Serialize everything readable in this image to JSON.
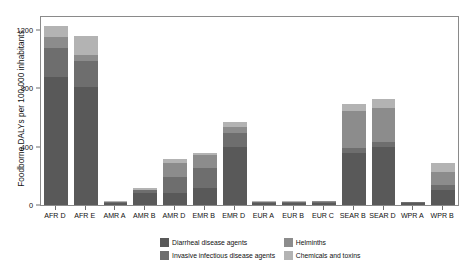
{
  "chart_data": {
    "type": "bar",
    "title": "",
    "subtitle": "",
    "xlabel": "",
    "ylabel": "Foodborne DALYs per 100,000 inhabitants",
    "ylim": [
      0,
      1290
    ],
    "yticks": [
      0,
      400,
      800,
      1200
    ],
    "ytick_labels": [
      "0",
      "400",
      "800",
      "1200"
    ],
    "grid": false,
    "stacked": true,
    "legend_position": "bottom",
    "categories": [
      "AFR D",
      "AFR E",
      "AMR A",
      "AMR B",
      "AMR D",
      "EMR B",
      "EMR D",
      "EUR A",
      "EUR B",
      "EUR C",
      "SEAR B",
      "SEAR D",
      "WPR A",
      "WPR B"
    ],
    "series": [
      {
        "name": "Diarrheal disease agents",
        "color": "#595959",
        "values": [
          880,
          810,
          14,
          80,
          80,
          120,
          400,
          13,
          16,
          17,
          355,
          395,
          13,
          100
        ]
      },
      {
        "name": "Invasive infectious disease agents",
        "color": "#6e6e6e",
        "values": [
          195,
          180,
          5,
          20,
          115,
          135,
          95,
          6,
          6,
          6,
          35,
          40,
          5,
          40
        ]
      },
      {
        "name": "Helminths",
        "color": "#8c8c8c",
        "values": [
          80,
          40,
          2,
          5,
          95,
          85,
          40,
          2,
          2,
          2,
          255,
          230,
          2,
          90
        ]
      },
      {
        "name": "Chemicals and toxins",
        "color": "#b3b3b3",
        "values": [
          75,
          130,
          4,
          10,
          25,
          20,
          35,
          4,
          5,
          5,
          45,
          60,
          4,
          60
        ]
      }
    ],
    "totals": [
      1230,
      1160,
      25,
      115,
      315,
      360,
      570,
      25,
      29,
      30,
      690,
      725,
      24,
      290
    ],
    "legend_entries": [
      "Diarrheal disease agents",
      "Invasive infectious disease agents",
      "Helminths",
      "Chemicals and toxins"
    ]
  },
  "colors": {
    "diarrheal": "#595959",
    "invasive": "#6e6e6e",
    "helminths": "#8c8c8c",
    "chemicals": "#b3b3b3",
    "panel_border": "#8a8a8a",
    "tick": "#6e6e6e",
    "background": "#ffffff",
    "text": "#111111"
  }
}
